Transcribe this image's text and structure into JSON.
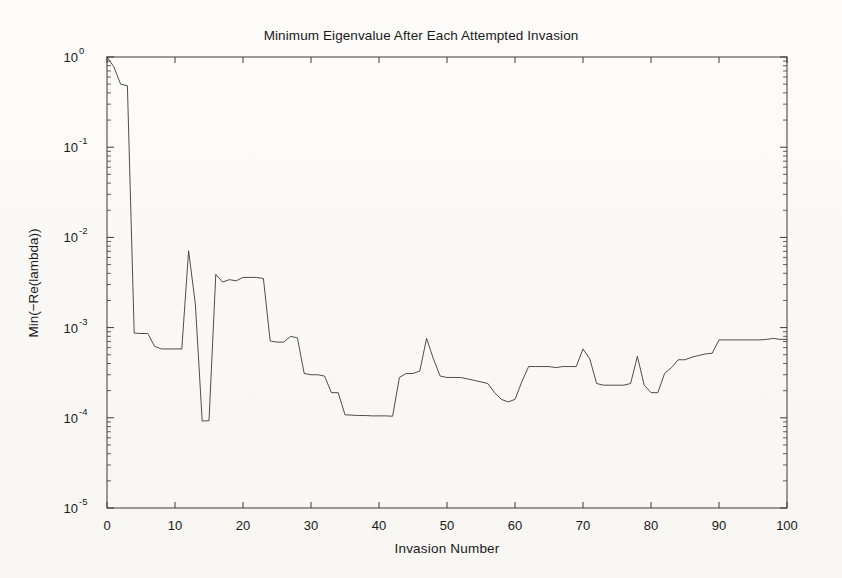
{
  "chart_data": {
    "type": "line",
    "title": "Minimum Eigenvalue After Each Attempted Invasion",
    "xlabel": "Invasion Number",
    "ylabel": "Min(−Re(lambda))",
    "xlim": [
      0,
      100
    ],
    "ylim": [
      1e-05,
      1
    ],
    "yscale": "log",
    "xscale": "linear",
    "grid": false,
    "legend": null,
    "xticks": [
      0,
      10,
      20,
      30,
      40,
      50,
      60,
      70,
      80,
      90,
      100
    ],
    "xtick_labels": [
      "0",
      "10",
      "20",
      "30",
      "40",
      "50",
      "60",
      "70",
      "80",
      "90",
      "100"
    ],
    "yticks": [
      1,
      0.1,
      0.01,
      0.001,
      0.0001,
      1e-05
    ],
    "ytick_labels": [
      "10^0",
      "10^-1",
      "10^-2",
      "10^-3",
      "10^-4",
      "10^-5"
    ],
    "ytick_mantissa": "10",
    "ytick_exponents": [
      "0",
      "-1",
      "-2",
      "-3",
      "-4",
      "-5"
    ],
    "minor_ticks": true,
    "line_color": "#3a3a3a",
    "line_width": 0.9,
    "series": [
      {
        "name": "Min(-Re(lambda))",
        "x": [
          0,
          1,
          2,
          3,
          4,
          5,
          6,
          7,
          8,
          9,
          10,
          11,
          12,
          13,
          14,
          15,
          16,
          17,
          18,
          19,
          20,
          21,
          22,
          23,
          24,
          25,
          26,
          27,
          28,
          29,
          30,
          31,
          32,
          33,
          34,
          35,
          36,
          37,
          38,
          39,
          40,
          41,
          42,
          43,
          44,
          45,
          46,
          47,
          48,
          49,
          50,
          51,
          52,
          53,
          54,
          55,
          56,
          57,
          58,
          59,
          60,
          61,
          62,
          63,
          64,
          65,
          66,
          67,
          68,
          69,
          70,
          71,
          72,
          73,
          74,
          75,
          76,
          77,
          78,
          79,
          80,
          81,
          82,
          83,
          84,
          85,
          86,
          87,
          88,
          89,
          90,
          91,
          92,
          93,
          94,
          95,
          96,
          97,
          98,
          99,
          100
        ],
        "y": [
          1.0,
          0.78,
          0.5,
          0.48,
          0.00087,
          0.00086,
          0.00086,
          0.00062,
          0.00058,
          0.00058,
          0.00058,
          0.00058,
          0.0071,
          0.0018,
          9.2e-05,
          9.3e-05,
          0.0039,
          0.0032,
          0.0034,
          0.0033,
          0.0036,
          0.0036,
          0.0036,
          0.0035,
          0.00071,
          0.00069,
          0.00069,
          0.0008,
          0.00077,
          0.00031,
          0.0003,
          0.0003,
          0.00029,
          0.00019,
          0.00019,
          0.000108,
          0.000107,
          0.000106,
          0.000106,
          0.000105,
          0.000105,
          0.000105,
          0.000104,
          0.00028,
          0.00031,
          0.00031,
          0.00033,
          0.00076,
          0.00045,
          0.00029,
          0.00028,
          0.00028,
          0.00028,
          0.00027,
          0.00026,
          0.00025,
          0.00024,
          0.00019,
          0.00016,
          0.00015,
          0.00016,
          0.00025,
          0.00037,
          0.00037,
          0.00037,
          0.00037,
          0.00036,
          0.00037,
          0.00037,
          0.00037,
          0.00058,
          0.00045,
          0.00024,
          0.00023,
          0.00023,
          0.00023,
          0.00023,
          0.00024,
          0.00048,
          0.00023,
          0.00019,
          0.00019,
          0.00031,
          0.00036,
          0.00044,
          0.00044,
          0.00047,
          0.00049,
          0.00051,
          0.00052,
          0.00073,
          0.00073,
          0.00073,
          0.00073,
          0.00073,
          0.00073,
          0.00073,
          0.00074,
          0.00076,
          0.00074,
          0.00074
        ]
      }
    ]
  },
  "figure": {
    "background_color": "#fbfaf7",
    "axes_color": "#3a3a3a",
    "text_color": "#1a1a1a"
  }
}
